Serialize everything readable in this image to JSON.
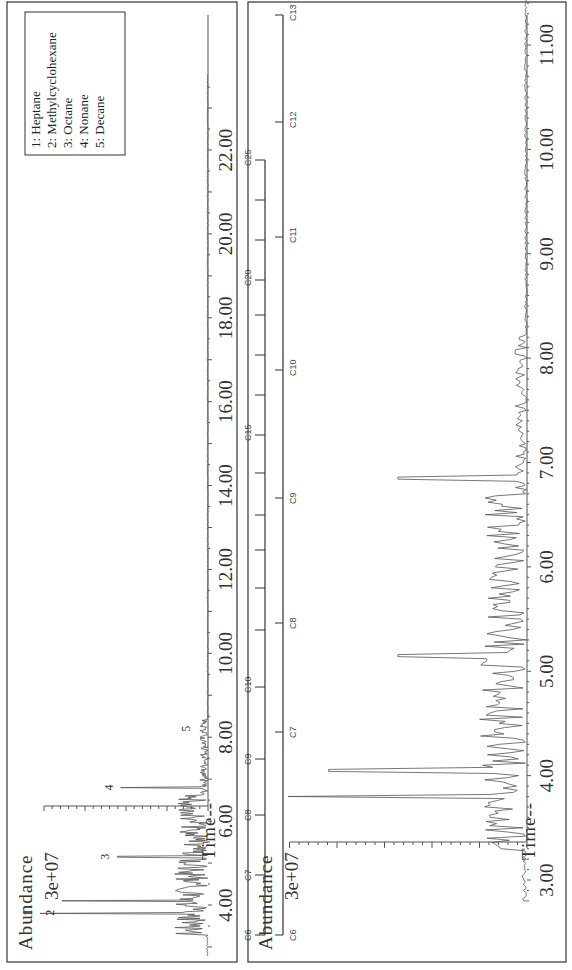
{
  "figure": {
    "top_panel": {
      "y_label": "Abundance",
      "y_tick": "3e+07",
      "x_label": "Time--",
      "x_ticks": [
        "4.00",
        "6.00",
        "8.00",
        "10.00",
        "12.00",
        "14.00",
        "16.00",
        "18.00",
        "20.00",
        "22.00"
      ],
      "peak_labels": [
        "1",
        "2",
        "3",
        "4",
        "5"
      ],
      "legend": [
        "1:  Heptane",
        "2:  Methylcyclohexane",
        "3:  Octane",
        "4:  Nonane",
        "5:  Decane"
      ]
    },
    "carbon_scale_long": {
      "labels": [
        "C6",
        "C7",
        "C8",
        "C9",
        "C10",
        "C15",
        "C20",
        "C25"
      ]
    },
    "carbon_scale_short": {
      "labels": [
        "C6",
        "C7",
        "C8",
        "C9",
        "C10",
        "C11",
        "C12",
        "C13"
      ]
    },
    "bottom_panel": {
      "y_label": "Abundance",
      "y_tick": "3e+07",
      "x_label": "Time--",
      "x_ticks": [
        "3.00",
        "4.00",
        "5.00",
        "6.00",
        "7.00",
        "8.00",
        "9.00",
        "10.00",
        "11.00"
      ]
    }
  },
  "chart_data": [
    {
      "type": "line",
      "title": "",
      "xlabel": "Time--",
      "ylabel": "Abundance",
      "xlim": [
        2.7,
        24.0
      ],
      "x_ticks": [
        4,
        6,
        8,
        10,
        12,
        14,
        16,
        18,
        20,
        22
      ],
      "y_tick_label": "3e+07",
      "grid": false,
      "legend_position": "upper right",
      "legend": [
        "1: Heptane",
        "2: Methylcyclohexane",
        "3: Octane",
        "4: Nonane",
        "5: Decane"
      ],
      "annotated_peaks": [
        {
          "label": "1",
          "compound": "Heptane",
          "time": 3.8,
          "relative_height": 1.0
        },
        {
          "label": "2",
          "compound": "Methylcyclohexane",
          "time": 4.1,
          "relative_height": 0.87
        },
        {
          "label": "3",
          "compound": "Octane",
          "time": 5.15,
          "relative_height": 0.54
        },
        {
          "label": "4",
          "compound": "Nonane",
          "time": 6.8,
          "relative_height": 0.52
        },
        {
          "label": "5",
          "compound": "Decane",
          "time": 8.2,
          "relative_height": 0.02
        }
      ],
      "notes": "Most signal between 3.3 and 8.5 min; flat baseline from ~9 to 24 min."
    },
    {
      "type": "line",
      "title": "",
      "xlabel": "Time--",
      "ylabel": "Abundance",
      "xlim": [
        2.7,
        11.6
      ],
      "x_ticks": [
        3,
        4,
        5,
        6,
        7,
        8,
        9,
        10,
        11
      ],
      "y_tick_label": "3e+07",
      "grid": false,
      "major_peaks": [
        {
          "time": 3.8,
          "relative_height": 1.0
        },
        {
          "time": 4.05,
          "relative_height": 0.83
        },
        {
          "time": 5.15,
          "relative_height": 0.54
        },
        {
          "time": 6.85,
          "relative_height": 0.54
        }
      ],
      "minor_peaks_range": [
        3.3,
        8.2
      ]
    },
    {
      "type": "table",
      "title": "n-alkane retention-index scales",
      "long_scale": {
        "labels": [
          "C6",
          "C7",
          "C8",
          "C9",
          "C10",
          "C15",
          "C20",
          "C25"
        ],
        "aligned_to": "top panel time axis"
      },
      "short_scale": {
        "labels": [
          "C6",
          "C7",
          "C8",
          "C9",
          "C10",
          "C11",
          "C12",
          "C13"
        ],
        "aligned_to": "bottom panel time axis"
      }
    }
  ]
}
